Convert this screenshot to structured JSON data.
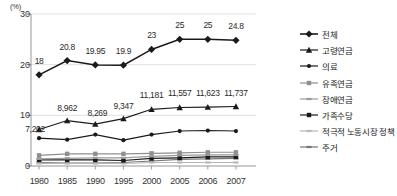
{
  "chart_data": {
    "type": "line",
    "title": "",
    "xlabel": "",
    "ylabel": "(%)",
    "x": [
      "1980",
      "1985",
      "1990",
      "1995",
      "2000",
      "2005",
      "2006",
      "2007"
    ],
    "ylim": [
      0,
      30
    ],
    "yticks": [
      "0",
      "10",
      "20",
      "30"
    ],
    "grid": true,
    "legend_position": "right",
    "series": [
      {
        "name": "전체",
        "marker": "diamond",
        "color": "#1a1a1a",
        "values": [
          18,
          20.8,
          19.95,
          19.9,
          23,
          25,
          25,
          24.8
        ],
        "labels": [
          "18",
          "20.8",
          "19.95",
          "19.9",
          "23",
          "25",
          "25",
          "24.8"
        ]
      },
      {
        "name": "고령연금",
        "marker": "triangle",
        "color": "#1a1a1a",
        "values": [
          7.202,
          8.962,
          8.269,
          9.347,
          11.181,
          11.557,
          11.623,
          11.737
        ],
        "labels": [
          "7,202",
          "8,962",
          "8,269",
          "9,347",
          "11,181",
          "11,557",
          "11,623",
          "11,737"
        ]
      },
      {
        "name": "의료",
        "marker": "circle",
        "color": "#1a1a1a",
        "values": [
          5.5,
          5.2,
          6.2,
          5.1,
          6.2,
          6.9,
          7.0,
          6.9
        ],
        "labels": []
      },
      {
        "name": "유족연금",
        "marker": "square",
        "color": "#8f8f8f",
        "values": [
          2.1,
          2.4,
          2.4,
          2.4,
          2.5,
          2.6,
          2.7,
          2.7
        ],
        "labels": []
      },
      {
        "name": "장애연금",
        "marker": "dash",
        "color": "#9a9a9a",
        "values": [
          1.4,
          1.5,
          1.6,
          1.6,
          1.9,
          2.1,
          2.2,
          2.2
        ],
        "labels": []
      },
      {
        "name": "가족수당",
        "marker": "square",
        "color": "#1a1a1a",
        "values": [
          1.2,
          1.2,
          1.2,
          1.1,
          1.5,
          1.6,
          1.8,
          1.8
        ],
        "labels": []
      },
      {
        "name": "적극적 노동시장 정책",
        "marker": "dash",
        "color": "#b8b8b8",
        "values": [
          0.5,
          0.5,
          0.5,
          0.5,
          0.7,
          0.7,
          0.7,
          0.7
        ],
        "labels": []
      },
      {
        "name": "주거",
        "marker": "dash",
        "color": "#767676",
        "values": [
          0.7,
          0.6,
          0.6,
          0.7,
          1.0,
          1.3,
          1.4,
          1.5
        ],
        "labels": []
      }
    ]
  }
}
